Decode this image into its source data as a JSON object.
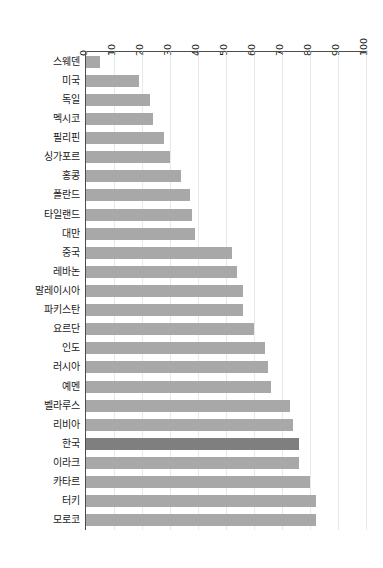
{
  "chart_data": {
    "type": "bar",
    "orientation": "horizontal",
    "title": "",
    "subtitle": "",
    "xlabel": "",
    "ylabel": "",
    "xlim": [
      0,
      100
    ],
    "xticks": [
      0,
      10,
      20,
      30,
      40,
      50,
      60,
      70,
      80,
      90,
      100
    ],
    "xtick_labels": [
      "0",
      "10",
      "20",
      "30",
      "40",
      "50",
      "60",
      "70",
      "80",
      "90",
      "100"
    ],
    "grid": true,
    "legend": null,
    "categories": [
      "스웨덴",
      "미국",
      "독일",
      "멕시코",
      "필리핀",
      "싱가포르",
      "홍콩",
      "폴란드",
      "타일랜드",
      "대만",
      "중국",
      "레바논",
      "말레이시아",
      "파키스탄",
      "요르단",
      "인도",
      "러시아",
      "예멘",
      "벨라루스",
      "리비아",
      "한국",
      "이라크",
      "카타르",
      "터키",
      "모로코"
    ],
    "values": [
      5,
      19,
      23,
      24,
      28,
      30,
      34,
      37,
      38,
      39,
      52,
      54,
      56,
      56,
      60,
      64,
      65,
      66,
      73,
      74,
      76,
      76,
      80,
      82,
      82
    ],
    "series_name": "",
    "bar_color": "#a8a8a8",
    "highlight_color": "#7f7f7f",
    "highlighted_categories": [
      "한국"
    ],
    "axis_color": "#4d4d4d",
    "gridline_color": "#e8e8e8",
    "background_color": "#ffffff",
    "xtick_label_rotation": "90"
  }
}
